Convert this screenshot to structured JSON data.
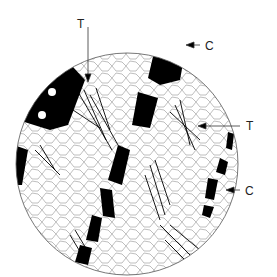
{
  "figure": {
    "labels": [
      {
        "text": "T",
        "x": 77,
        "y": 18
      },
      {
        "text": "C",
        "x": 205,
        "y": 40
      },
      {
        "text": "T",
        "x": 246,
        "y": 120
      },
      {
        "text": "C",
        "x": 245,
        "y": 185
      }
    ],
    "colors": {
      "background": "#ffffff",
      "ink": "#000000",
      "circle": "#555555"
    }
  }
}
